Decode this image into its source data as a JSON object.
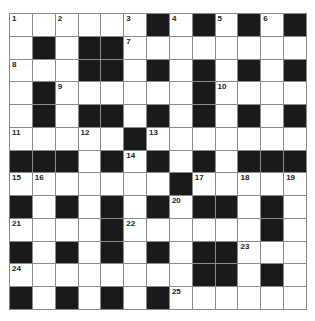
{
  "puzzle": {
    "rows": 13,
    "cols": 13,
    "colors": {
      "black": "#1a1a1a",
      "white": "#ffffff",
      "line": "#8a8a8a"
    },
    "grid": [
      [
        "1",
        ".",
        "2",
        ".",
        ".",
        "3",
        "#",
        "4",
        "#",
        "5",
        "#",
        "6",
        "#"
      ],
      [
        ".",
        "#",
        ".",
        "#",
        "#",
        "7",
        ".",
        ".",
        ".",
        ".",
        ".",
        ".",
        "."
      ],
      [
        "8",
        ".",
        ".",
        "#",
        "#",
        ".",
        "#",
        ".",
        "#",
        ".",
        "#",
        ".",
        "#"
      ],
      [
        ".",
        "#",
        "9",
        ".",
        ".",
        ".",
        ".",
        ".",
        "#",
        "10",
        ".",
        ".",
        "."
      ],
      [
        ".",
        "#",
        ".",
        "#",
        "#",
        ".",
        "#",
        ".",
        "#",
        ".",
        "#",
        ".",
        "#"
      ],
      [
        "11",
        ".",
        ".",
        "12",
        ".",
        "#",
        "13",
        ".",
        ".",
        ".",
        ".",
        ".",
        "."
      ],
      [
        "#",
        "#",
        "#",
        ".",
        "#",
        "14",
        "#",
        ".",
        "#",
        ".",
        "#",
        "#",
        "#"
      ],
      [
        "15",
        "16",
        ".",
        ".",
        ".",
        ".",
        ".",
        "#",
        "17",
        ".",
        "18",
        ".",
        "19"
      ],
      [
        "#",
        ".",
        "#",
        ".",
        "#",
        ".",
        "#",
        "20",
        "#",
        "#",
        ".",
        "#",
        "."
      ],
      [
        "21",
        ".",
        ".",
        ".",
        "#",
        "22",
        ".",
        ".",
        ".",
        ".",
        ".",
        "#",
        "."
      ],
      [
        "#",
        ".",
        "#",
        ".",
        "#",
        ".",
        "#",
        ".",
        "#",
        "#",
        "23",
        ".",
        "."
      ],
      [
        "24",
        ".",
        ".",
        ".",
        ".",
        ".",
        ".",
        ".",
        "#",
        "#",
        ".",
        "#",
        "."
      ],
      [
        "#",
        ".",
        "#",
        ".",
        "#",
        ".",
        "#",
        "25",
        ".",
        ".",
        ".",
        ".",
        "."
      ]
    ]
  }
}
